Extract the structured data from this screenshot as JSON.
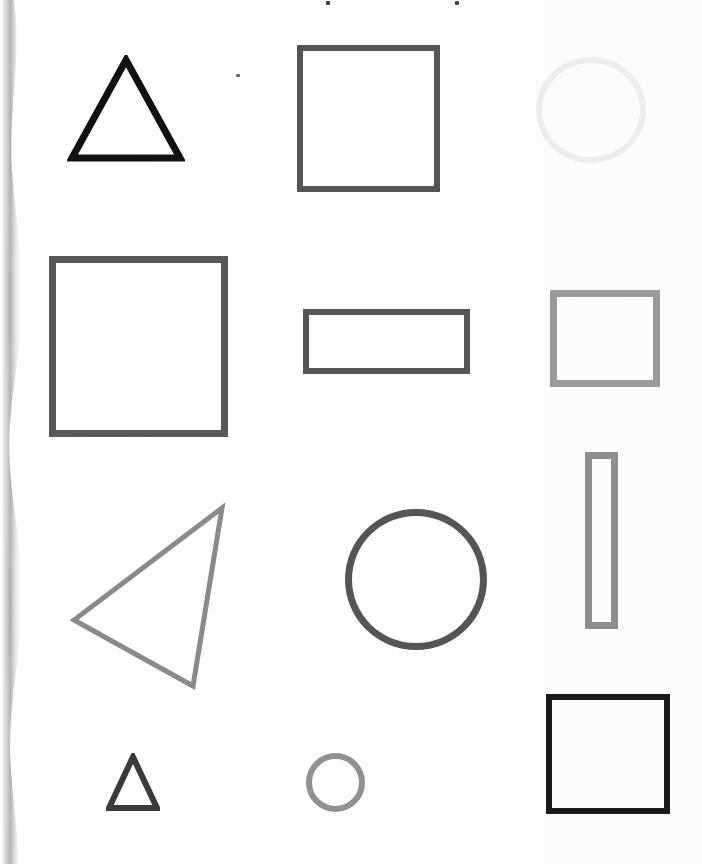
{
  "document": {
    "kind": "scanned-worksheet",
    "title": "Geometric Shapes Page",
    "background_color": "#fefefe",
    "width": 702,
    "height": 864,
    "has_left_page_edge_shadow": true,
    "text_content": ""
  },
  "palette": {
    "near_black": "#111111",
    "black": "#1a1a1a",
    "charcoal": "#3a3a3a",
    "dark_gray": "#555555",
    "dark_gray_alt": "#585858",
    "mid_gray": "#8a8a8a",
    "mid_gray_alt": "#8e8e8e",
    "gray": "#919191",
    "light_mid_gray": "#9a9a9a",
    "very_light_gray": "#ededed",
    "paper": "#fefefe"
  },
  "grid": {
    "rows": 4,
    "columns": 3,
    "row_labels": [
      "row-1",
      "row-2",
      "row-3",
      "row-4"
    ],
    "column_labels": [
      "column-left",
      "column-center",
      "column-right"
    ]
  },
  "shapes": [
    {
      "id": "shape-1",
      "name": "triangle-large-black",
      "type": "triangle",
      "row": 1,
      "column": "left",
      "x": 67,
      "y": 55,
      "width": 118,
      "height": 108,
      "color": "#111111",
      "stroke_width": 7,
      "fill": "none",
      "orientation": "point-up",
      "size_label": "large"
    },
    {
      "id": "shape-2",
      "name": "square-darkgray-top",
      "type": "square",
      "row": 1,
      "column": "center",
      "x": 297,
      "y": 45,
      "width": 143,
      "height": 147,
      "color": "#555555",
      "stroke_width": 6,
      "fill": "none",
      "orientation": "upright",
      "size_label": "large"
    },
    {
      "id": "shape-3",
      "name": "circle-verylight-top",
      "type": "circle",
      "row": 1,
      "column": "right",
      "x": 536,
      "y": 57,
      "width": 110,
      "height": 106,
      "color": "#ededed",
      "stroke_width": 6,
      "fill": "none",
      "orientation": "n/a",
      "size_label": "medium"
    },
    {
      "id": "shape-4",
      "name": "square-large-darkgray",
      "type": "square",
      "row": 2,
      "column": "left",
      "x": 49,
      "y": 256,
      "width": 179,
      "height": 181,
      "color": "#585858",
      "stroke_width": 7,
      "fill": "none",
      "orientation": "upright",
      "size_label": "extra-large"
    },
    {
      "id": "shape-5",
      "name": "rectangle-wide-darkgray",
      "type": "rectangle",
      "row": 2,
      "column": "center",
      "x": 303,
      "y": 309,
      "width": 167,
      "height": 65,
      "color": "#555555",
      "stroke_width": 6,
      "fill": "none",
      "orientation": "landscape",
      "size_label": "medium"
    },
    {
      "id": "shape-6",
      "name": "square-medium-gray",
      "type": "square",
      "row": 2,
      "column": "right",
      "x": 550,
      "y": 290,
      "width": 110,
      "height": 97,
      "color": "#9a9a9a",
      "stroke_width": 7,
      "fill": "none",
      "orientation": "upright",
      "size_label": "medium"
    },
    {
      "id": "shape-7",
      "name": "rectangle-tall-narrow-gray",
      "type": "rectangle",
      "row": 3,
      "column": "right",
      "x": 585,
      "y": 452,
      "width": 33,
      "height": 177,
      "color": "#8e8e8e",
      "stroke_width": 7,
      "fill": "none",
      "orientation": "portrait",
      "size_label": "tall-narrow"
    },
    {
      "id": "shape-8",
      "name": "triangle-rotated-gray",
      "type": "triangle",
      "row": 3,
      "column": "left",
      "x": 70,
      "y": 500,
      "width": 160,
      "height": 190,
      "color": "#8a8a8a",
      "stroke_width": 5,
      "fill": "none",
      "orientation": "point-left-rotated",
      "size_label": "large"
    },
    {
      "id": "shape-9",
      "name": "circle-large-darkgray",
      "type": "circle",
      "row": 3,
      "column": "center",
      "x": 345,
      "y": 509,
      "width": 142,
      "height": 141,
      "color": "#555555",
      "stroke_width": 7,
      "fill": "none",
      "orientation": "n/a",
      "size_label": "large"
    },
    {
      "id": "shape-10",
      "name": "triangle-small-charcoal",
      "type": "triangle",
      "row": 4,
      "column": "left",
      "x": 106,
      "y": 753,
      "width": 54,
      "height": 59,
      "color": "#3a3a3a",
      "stroke_width": 6,
      "fill": "none",
      "orientation": "point-up",
      "size_label": "small"
    },
    {
      "id": "shape-11",
      "name": "circle-small-gray",
      "type": "circle",
      "row": 4,
      "column": "center",
      "x": 306,
      "y": 753,
      "width": 59,
      "height": 59,
      "color": "#919191",
      "stroke_width": 6,
      "fill": "none",
      "orientation": "n/a",
      "size_label": "small"
    },
    {
      "id": "shape-12",
      "name": "square-black-bottom",
      "type": "square",
      "row": 4,
      "column": "right",
      "x": 546,
      "y": 694,
      "width": 124,
      "height": 120,
      "color": "#1a1a1a",
      "stroke_width": 6,
      "fill": "none",
      "orientation": "upright",
      "size_label": "large"
    }
  ],
  "artifacts": {
    "specks": [
      {
        "name": "speck-top-left",
        "x": 326,
        "y": 1,
        "w": 4,
        "h": 4,
        "color": "#3c3c3c"
      },
      {
        "name": "speck-top-right",
        "x": 455,
        "y": 1,
        "w": 4,
        "h": 4,
        "color": "#454545"
      },
      {
        "name": "speck-mid-upper",
        "x": 236,
        "y": 74,
        "w": 4,
        "h": 3,
        "color": "#6a6a6a"
      }
    ],
    "speck_count": 3,
    "edge_shadow_color": "#a8a8a8"
  },
  "summary": {
    "total_shapes": 12,
    "triangles": 3,
    "squares": 4,
    "rectangles": 2,
    "circles": 3
  }
}
